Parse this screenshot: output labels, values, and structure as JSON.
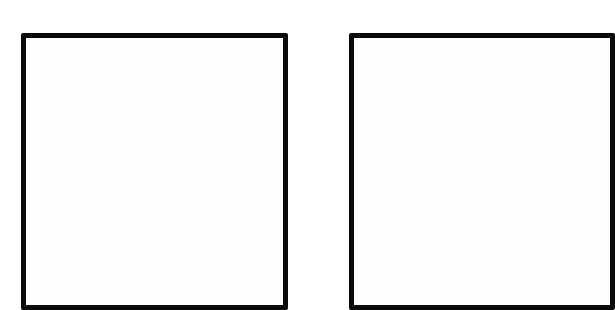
{
  "diagram": {
    "boxes": [
      {
        "id": "left",
        "label": "",
        "border_color": "#0a0a0a",
        "fill": "#fefefe"
      },
      {
        "id": "right",
        "label": "",
        "border_color": "#0a0a0a",
        "fill": "#fefefe"
      }
    ]
  }
}
